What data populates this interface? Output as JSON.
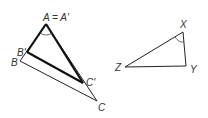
{
  "diagram": {
    "colors": {
      "stroke": "#222222",
      "label": "#333333"
    },
    "triangle_abc": {
      "vertices": {
        "A": {
          "x": 46,
          "y": 24
        },
        "B": {
          "x": 20,
          "y": 61
        },
        "C": {
          "x": 97,
          "y": 101
        },
        "B_prime": {
          "x": 27,
          "y": 52
        },
        "C_prime": {
          "x": 83,
          "y": 83
        }
      },
      "labels": {
        "A": "A = A'",
        "B_prime": "B'",
        "B": "B",
        "C_prime": "C'",
        "C": "C"
      },
      "angle_mark_at": "A"
    },
    "triangle_xyz": {
      "vertices": {
        "X": {
          "x": 183,
          "y": 32
        },
        "Y": {
          "x": 186,
          "y": 66
        },
        "Z": {
          "x": 125,
          "y": 67
        }
      },
      "labels": {
        "X": "X",
        "Y": "Y",
        "Z": "Z"
      },
      "angle_mark_at": "X"
    }
  }
}
